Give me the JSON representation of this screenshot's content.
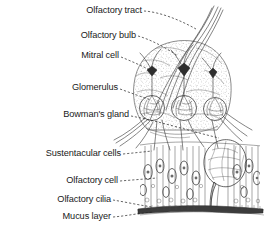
{
  "figure": {
    "type": "anatomical-line-illustration",
    "background_color": "#ffffff",
    "ink_color": "#2a2a2a",
    "label_color": "#1a1a1a",
    "leader_style": "dashed",
    "labels": [
      {
        "id": "olfactory-tract",
        "text": "Olfactory tract",
        "x": 142,
        "y": 13,
        "target_x": 196,
        "target_y": 29
      },
      {
        "id": "olfactory-bulb",
        "text": "Olfactory bulb",
        "x": 136,
        "y": 38,
        "target_x": 178,
        "target_y": 56
      },
      {
        "id": "mitral-cell",
        "text": "Mitral cell",
        "x": 119,
        "y": 58,
        "target_x": 152,
        "target_y": 70
      },
      {
        "id": "glomerulus",
        "text": "Glomerulus",
        "x": 118,
        "y": 90,
        "target_x": 152,
        "target_y": 100
      },
      {
        "id": "bowmans-gland",
        "text": "Bowman's gland",
        "x": 129,
        "y": 117,
        "target_x": 220,
        "target_y": 138
      },
      {
        "id": "sustentacular-cells",
        "text": "Sustentacular cells",
        "x": 121,
        "y": 156,
        "target_x": 152,
        "target_y": 152
      },
      {
        "id": "olfactory-cell",
        "text": "Olfactory cell",
        "x": 118,
        "y": 183,
        "target_x": 157,
        "target_y": 178
      },
      {
        "id": "olfactory-cilia",
        "text": "Olfactory cilia",
        "x": 111,
        "y": 202,
        "target_x": 152,
        "target_y": 207
      },
      {
        "id": "mucus-layer",
        "text": "Mucus layer",
        "x": 111,
        "y": 219,
        "target_x": 153,
        "target_y": 212
      }
    ],
    "caption": "",
    "structures": {
      "bulb": "olfactory bulb dome with stippled texture",
      "tract": "olfactory nerve tract fibers exiting upward",
      "mitral_cells": 3,
      "glomeruli": 3,
      "bowmans_gland": "large bulbous secretory gland",
      "epithelium": "columnar sustentacular and olfactory receptor cells",
      "mucus_layer": "dark horizontal band at base"
    }
  }
}
